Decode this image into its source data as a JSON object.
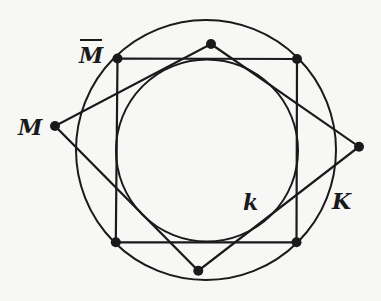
{
  "diagram": {
    "stroke_color": "#1a1a1a",
    "background": "#f7f7f5",
    "outer_circle": {
      "label": "K",
      "cx": 206,
      "cy": 150,
      "r": 130
    },
    "inner_circle": {
      "label": "k",
      "cx": 207,
      "cy": 150.5,
      "r": 91
    },
    "square": {
      "vertices": [
        [
          117.5,
          58.5
        ],
        [
          297,
          59
        ],
        [
          296.5,
          242.3
        ],
        [
          115.8,
          242.3
        ]
      ]
    },
    "rhombus": {
      "vertices": [
        [
          211,
          44
        ],
        [
          359,
          146.7
        ],
        [
          198.3,
          270.7
        ],
        [
          55,
          126
        ]
      ]
    },
    "points": [
      [
        117.5,
        58.5
      ],
      [
        297,
        59
      ],
      [
        296.5,
        242.3
      ],
      [
        115.8,
        242.3
      ],
      [
        211,
        44
      ],
      [
        359,
        146.7
      ],
      [
        198.3,
        270.7
      ],
      [
        55,
        126
      ]
    ],
    "labels": [
      {
        "id": "M",
        "text": "M",
        "x": 18,
        "y": 135,
        "size": 22,
        "overbar": false
      },
      {
        "id": "M-bar",
        "text": "M",
        "x": 79,
        "y": 63,
        "size": 22,
        "overbar": true
      },
      {
        "id": "k",
        "text": "k",
        "x": 243,
        "y": 210,
        "size": 22,
        "overbar": false
      },
      {
        "id": "K",
        "text": "K",
        "x": 332,
        "y": 209,
        "size": 22,
        "overbar": false
      }
    ]
  }
}
